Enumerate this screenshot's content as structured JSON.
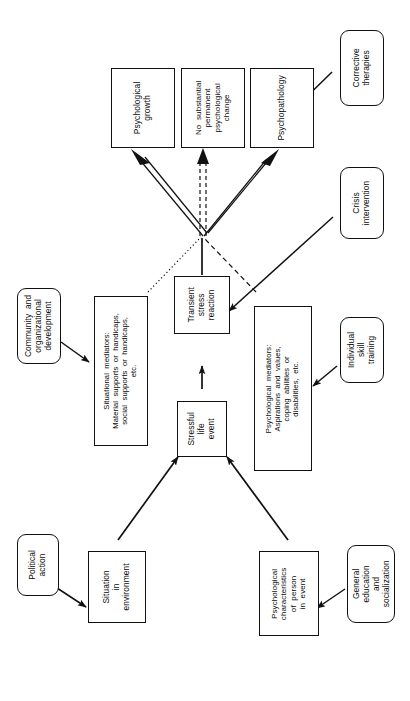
{
  "figure": {
    "type": "flowchart",
    "orientation": "rotated-90-ccw",
    "background": "#ffffff",
    "line_color": "#111111"
  },
  "nodes": {
    "psychological_growth": {
      "label": "Psychological\ngrowth"
    },
    "no_change": {
      "label": "No  substantial\npermanent\npsychological\nchange"
    },
    "psychopathology": {
      "label": "Psychopathology"
    },
    "corrective_therapies": {
      "label": "Corrective\ntherapies"
    },
    "crisis_intervention": {
      "label": "Crisis\nintervention"
    },
    "transient_stress_reaction": {
      "label": "Transient\nstress\nreaction"
    },
    "situational_mediators": {
      "label": "Situational  mediators:\nMaterial  supports  or  handicaps,\nsocial  supports  or  handicaps,\netc."
    },
    "psychological_mediators": {
      "label": "Psychological  mediators:\nAspirations  and  values,\ncoping  abilities  or\ndisabilities,  etc."
    },
    "community_development": {
      "label": "Community  and\norganizational\ndevelopment"
    },
    "individual_skill_training": {
      "label": "Individual\nskill\ntraining"
    },
    "stressful_life_event": {
      "label": "Stressful\nlife\nevent"
    },
    "situation_in_environment": {
      "label": "Situation\nin\nenvironment"
    },
    "psychological_characteristics": {
      "label": "Psychological\ncharacteristics\nof  person\nin  event"
    },
    "political_action": {
      "label": "Political\naction"
    },
    "general_education": {
      "label": "General\neducation\nand\nsocialization"
    }
  }
}
